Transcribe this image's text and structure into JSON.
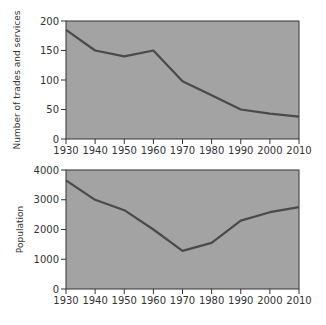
{
  "chart_data": [
    {
      "type": "line",
      "title": "",
      "xlabel": "",
      "ylabel": "Number of trades and services",
      "x": [
        1930,
        1940,
        1950,
        1960,
        1970,
        1980,
        1990,
        2000,
        2010
      ],
      "values": [
        185,
        150,
        140,
        150,
        98,
        74,
        50,
        43,
        38
      ],
      "xlim": [
        1930,
        2010
      ],
      "ylim": [
        0,
        200
      ],
      "yticks": [
        0,
        50,
        100,
        150,
        200
      ],
      "xticks": [
        1930,
        1940,
        1950,
        1960,
        1970,
        1980,
        1990,
        2000,
        2010
      ],
      "grid": false,
      "legend": null
    },
    {
      "type": "line",
      "title": "",
      "xlabel": "",
      "ylabel": "Population",
      "x": [
        1930,
        1940,
        1950,
        1960,
        1970,
        1980,
        1990,
        2000,
        2010
      ],
      "values": [
        3650,
        3000,
        2650,
        2000,
        1280,
        1550,
        2300,
        2580,
        2750
      ],
      "xlim": [
        1930,
        2010
      ],
      "ylim": [
        0,
        4000
      ],
      "yticks": [
        0,
        1000,
        2000,
        3000,
        4000
      ],
      "xticks": [
        1930,
        1940,
        1950,
        1960,
        1970,
        1980,
        1990,
        2000,
        2010
      ],
      "grid": false,
      "legend": null
    }
  ],
  "colors": {
    "plot_bg": "#a3a3a3",
    "line": "#4a4a4a",
    "axis": "#333333"
  }
}
